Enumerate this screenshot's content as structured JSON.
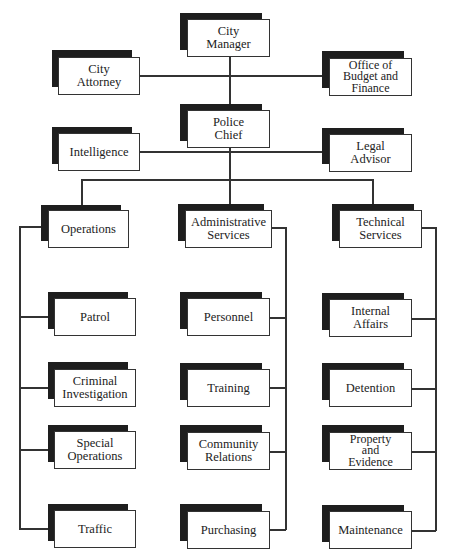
{
  "diagram": {
    "type": "organizational-chart",
    "nodes": {
      "city_manager": "City\nManager",
      "city_attorney": "City\nAttorney",
      "budget_finance": "Office of\nBudget and\nFinance",
      "police_chief": "Police\nChief",
      "intelligence": "Intelligence",
      "legal_advisor": "Legal\nAdvisor",
      "operations": "Operations",
      "administrative_services": "Administrative\nServices",
      "technical_services": "Technical\nServices",
      "patrol": "Patrol",
      "criminal_investigation": "Criminal\nInvestigation",
      "special_operations": "Special\nOperations",
      "traffic": "Traffic",
      "personnel": "Personnel",
      "training": "Training",
      "community_relations": "Community\nRelations",
      "purchasing": "Purchasing",
      "internal_affairs": "Internal\nAffairs",
      "detention": "Detention",
      "property_evidence": "Property\nand\nEvidence",
      "maintenance": "Maintenance"
    },
    "hierarchy": {
      "City Manager": {
        "staff": [
          "City Attorney",
          "Office of Budget and Finance"
        ],
        "children": [
          "Police Chief"
        ]
      },
      "Police Chief": {
        "staff": [
          "Intelligence",
          "Legal Advisor"
        ],
        "children": [
          "Operations",
          "Administrative Services",
          "Technical Services"
        ]
      },
      "Operations": [
        "Patrol",
        "Criminal Investigation",
        "Special Operations",
        "Traffic"
      ],
      "Administrative Services": [
        "Personnel",
        "Training",
        "Community Relations",
        "Purchasing"
      ],
      "Technical Services": [
        "Internal Affairs",
        "Detention",
        "Property and Evidence",
        "Maintenance"
      ]
    },
    "colors": {
      "shadow": "#1e1e1e",
      "border": "#333333",
      "box": "#ffffff"
    }
  }
}
